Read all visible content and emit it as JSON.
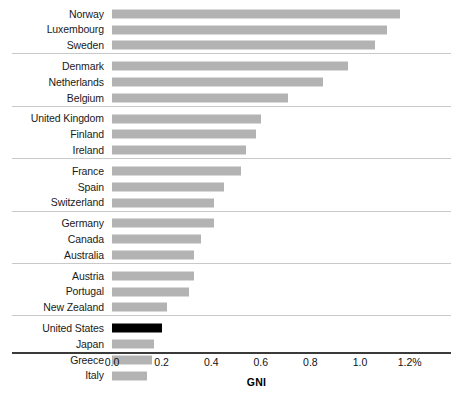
{
  "chart_data": {
    "type": "bar",
    "orientation": "horizontal",
    "title": "",
    "xlabel": "GNI",
    "ylabel": "",
    "xlim": [
      0.0,
      1.25
    ],
    "grid": false,
    "legend": null,
    "tick_labels": [
      "0.0",
      "0.2",
      "0.4",
      "0.6",
      "0.8",
      "1.0",
      "1.2%"
    ],
    "tick_values": [
      0.0,
      0.2,
      0.4,
      0.6,
      0.8,
      1.0,
      1.2
    ],
    "highlight_category": "United States",
    "colors": {
      "bar": "#b3b3b3",
      "highlight_bar": "#000000",
      "axis": "#3a3a3a",
      "separator": "#c9c9c9",
      "text": "#111111",
      "background": "#ffffff"
    },
    "groups": [
      {
        "items": [
          {
            "category": "Norway",
            "value": 1.16,
            "highlight": false
          },
          {
            "category": "Luxembourg",
            "value": 1.11,
            "highlight": false
          },
          {
            "category": "Sweden",
            "value": 1.06,
            "highlight": false
          }
        ]
      },
      {
        "items": [
          {
            "category": "Denmark",
            "value": 0.95,
            "highlight": false
          },
          {
            "category": "Netherlands",
            "value": 0.85,
            "highlight": false
          },
          {
            "category": "Belgium",
            "value": 0.71,
            "highlight": false
          }
        ]
      },
      {
        "items": [
          {
            "category": "United Kingdom",
            "value": 0.6,
            "highlight": false
          },
          {
            "category": "Finland",
            "value": 0.58,
            "highlight": false
          },
          {
            "category": "Ireland",
            "value": 0.54,
            "highlight": false
          }
        ]
      },
      {
        "items": [
          {
            "category": "France",
            "value": 0.52,
            "highlight": false
          },
          {
            "category": "Spain",
            "value": 0.45,
            "highlight": false
          },
          {
            "category": "Switzerland",
            "value": 0.41,
            "highlight": false
          }
        ]
      },
      {
        "items": [
          {
            "category": "Germany",
            "value": 0.41,
            "highlight": false
          },
          {
            "category": "Canada",
            "value": 0.36,
            "highlight": false
          },
          {
            "category": "Australia",
            "value": 0.33,
            "highlight": false
          }
        ]
      },
      {
        "items": [
          {
            "category": "Austria",
            "value": 0.33,
            "highlight": false
          },
          {
            "category": "Portugal",
            "value": 0.31,
            "highlight": false
          },
          {
            "category": "New Zealand",
            "value": 0.22,
            "highlight": false
          }
        ]
      },
      {
        "items": [
          {
            "category": "United States",
            "value": 0.2,
            "highlight": true
          },
          {
            "category": "Japan",
            "value": 0.17,
            "highlight": false
          },
          {
            "category": "Greece",
            "value": 0.16,
            "highlight": false
          },
          {
            "category": "Italy",
            "value": 0.14,
            "highlight": false
          }
        ]
      }
    ]
  }
}
